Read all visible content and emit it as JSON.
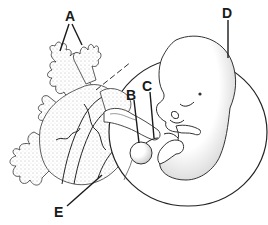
{
  "diagram": {
    "title": "",
    "labels": [
      {
        "id": "A",
        "text": "A",
        "points_to": "chorionic villi"
      },
      {
        "id": "B",
        "text": "B",
        "points_to": "yolk sac"
      },
      {
        "id": "C",
        "text": "C",
        "points_to": "umbilical cord"
      },
      {
        "id": "D",
        "text": "D",
        "points_to": "amniotic sac"
      },
      {
        "id": "E",
        "text": "E",
        "points_to": "placenta / uterine wall"
      }
    ],
    "colors": {
      "ink": "#1a1a1a",
      "background": "#ffffff"
    }
  }
}
